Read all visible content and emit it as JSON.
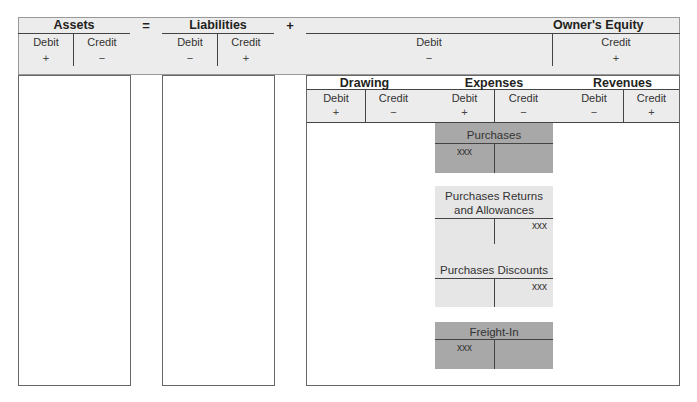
{
  "equation": {
    "assets": {
      "title": "Assets",
      "debit": "Debit",
      "credit": "Credit",
      "debit_sign": "+",
      "credit_sign": "−"
    },
    "equals": "=",
    "liabilities": {
      "title": "Liabilities",
      "debit": "Debit",
      "credit": "Credit",
      "debit_sign": "−",
      "credit_sign": "+"
    },
    "plus": "+",
    "owners_equity": {
      "title": "Owner's Equity",
      "debit": "Debit",
      "credit": "Credit",
      "debit_sign": "−",
      "credit_sign": "+"
    }
  },
  "equity_subaccounts": {
    "drawing": {
      "title": "Drawing",
      "debit": "Debit",
      "credit": "Credit",
      "debit_sign": "+",
      "credit_sign": "−"
    },
    "expenses": {
      "title": "Expenses",
      "debit": "Debit",
      "credit": "Credit",
      "debit_sign": "+",
      "credit_sign": "−"
    },
    "revenues": {
      "title": "Revenues",
      "debit": "Debit",
      "credit": "Credit",
      "debit_sign": "−",
      "credit_sign": "+"
    }
  },
  "t_accounts": [
    {
      "name": "Purchases",
      "side": "debit",
      "amount": "xxx",
      "shade": "dark"
    },
    {
      "name_line1": "Purchases Returns",
      "name_line2": "and Allowances",
      "side": "credit",
      "amount": "xxx",
      "shade": "light"
    },
    {
      "name": "Purchases Discounts",
      "side": "credit",
      "amount": "xxx",
      "shade": "light"
    },
    {
      "name": "Freight-In",
      "side": "debit",
      "amount": "xxx",
      "shade": "dark"
    }
  ],
  "colors": {
    "band": "#ececec",
    "dark_account": "#a8a8a8",
    "light_account": "#e6e6e6",
    "line": "#444444"
  }
}
